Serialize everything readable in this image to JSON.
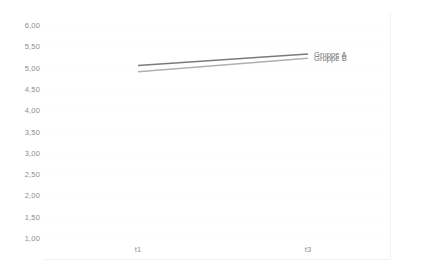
{
  "chart_data": {
    "type": "line",
    "title": "",
    "xlabel": "",
    "ylabel": "",
    "categories": [
      "t1",
      "t3"
    ],
    "x_tick_labels": [
      "t1",
      "t3"
    ],
    "ylim": [
      1.0,
      6.0
    ],
    "y_tick_labels": [
      "6,00",
      "5,50",
      "5,00",
      "4,50",
      "4,00",
      "3,50",
      "3,00",
      "2,50",
      "2,00",
      "1,50",
      "1,00"
    ],
    "y_tick_values": [
      6.0,
      5.5,
      5.0,
      4.5,
      4.0,
      3.5,
      3.0,
      2.5,
      2.0,
      1.5,
      1.0
    ],
    "grid": true,
    "grid_axis": "y",
    "legend_position": "inline-right",
    "series": [
      {
        "name": "Gruppe A",
        "values": [
          5.05,
          5.32
        ],
        "color": "#7a7a7a"
      },
      {
        "name": "Gruppe B",
        "values": [
          4.9,
          5.22
        ],
        "color": "#b0b0b0"
      }
    ]
  },
  "axis": {
    "y_ticks": [
      {
        "label": "6,00",
        "value": 6.0
      },
      {
        "label": "5,50",
        "value": 5.5
      },
      {
        "label": "5,00",
        "value": 5.0
      },
      {
        "label": "4,50",
        "value": 4.5
      },
      {
        "label": "4,00",
        "value": 4.0
      },
      {
        "label": "3,50",
        "value": 3.5
      },
      {
        "label": "3,00",
        "value": 3.0
      },
      {
        "label": "2,50",
        "value": 2.5
      },
      {
        "label": "2,00",
        "value": 2.0
      },
      {
        "label": "1,50",
        "value": 1.5
      },
      {
        "label": "1,00",
        "value": 1.0
      }
    ],
    "x_ticks": [
      {
        "label": "t1",
        "index": 0
      },
      {
        "label": "t3",
        "index": 1
      }
    ]
  },
  "legend": {
    "items": [
      {
        "label": "Gruppe A",
        "color": "#7a7a7a"
      },
      {
        "label": "Gruppe B",
        "color": "#b0b0b0"
      }
    ]
  },
  "colors": {
    "background": "#ffffff",
    "grid": "#fbfbfb",
    "frame": "#f3f3f3",
    "tick_text": "#8d8d8d",
    "legend_text": "#6f6f6f",
    "series_a": "#7a7a7a",
    "series_b": "#b0b0b0"
  }
}
